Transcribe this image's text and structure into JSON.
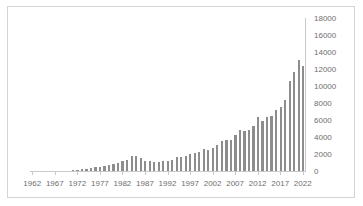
{
  "chart_data": {
    "type": "bar",
    "title": "",
    "subtitle": "",
    "xlabel": "",
    "ylabel": "",
    "ylim": [
      0,
      18000
    ],
    "y_tick_step": 2000,
    "y_ticks": [
      "0",
      "2000",
      "4000",
      "6000",
      "8000",
      "10000",
      "12000",
      "14000",
      "16000",
      "18000"
    ],
    "x_tick_labels": [
      "1962",
      "1967",
      "1972",
      "1977",
      "1982",
      "1987",
      "1992",
      "1997",
      "2002",
      "2007",
      "2012",
      "2017",
      "2022"
    ],
    "x_tick_step": 5,
    "grid": false,
    "legend": null,
    "legend_position": "none",
    "bar_color": "#8d8d8d",
    "axis_color": "#c9c9c9",
    "border_color": "#d4d4d4",
    "label_color": "#6e6e6e",
    "categories": [
      "1962",
      "1963",
      "1964",
      "1965",
      "1966",
      "1967",
      "1968",
      "1969",
      "1970",
      "1971",
      "1972",
      "1973",
      "1974",
      "1975",
      "1976",
      "1977",
      "1978",
      "1979",
      "1980",
      "1981",
      "1982",
      "1983",
      "1984",
      "1985",
      "1986",
      "1987",
      "1988",
      "1989",
      "1990",
      "1991",
      "1992",
      "1993",
      "1994",
      "1995",
      "1996",
      "1997",
      "1998",
      "1999",
      "2000",
      "2001",
      "2002",
      "2003",
      "2004",
      "2005",
      "2006",
      "2007",
      "2008",
      "2009",
      "2010",
      "2011",
      "2012",
      "2013",
      "2014",
      "2015",
      "2016",
      "2017",
      "2018",
      "2019",
      "2020",
      "2021",
      "2022"
    ],
    "values": [
      10,
      12,
      15,
      18,
      20,
      25,
      30,
      40,
      55,
      75,
      110,
      200,
      290,
      360,
      430,
      520,
      640,
      760,
      880,
      1000,
      1120,
      1250,
      1750,
      1800,
      1500,
      1180,
      1130,
      1100,
      1080,
      1200,
      1180,
      1250,
      1600,
      1700,
      1800,
      1950,
      2100,
      2250,
      2550,
      2500,
      2750,
      3100,
      3500,
      3650,
      3700,
      4200,
      4800,
      4700,
      4850,
      5300,
      6400,
      5850,
      6400,
      6500,
      7150,
      7550,
      8300,
      10600,
      11700,
      13100,
      12400
    ]
  }
}
